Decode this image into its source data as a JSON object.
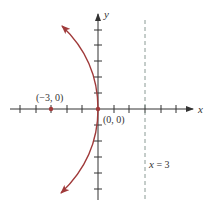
{
  "diagram": {
    "type": "coordinate-plane",
    "axes": {
      "x_label": "x",
      "y_label": "y",
      "x_ticks": [
        -5,
        -4,
        -3,
        -2,
        -1,
        1,
        2,
        3,
        4,
        5
      ],
      "y_ticks": [
        -5,
        -4,
        -3,
        -2,
        -1,
        1,
        2,
        3,
        4,
        5
      ]
    },
    "curve": {
      "name": "parabola",
      "equation": "y^2 = -12x",
      "color": "#a03a3a",
      "opens": "left"
    },
    "points": [
      {
        "label": "(−3, 0)",
        "x": -3,
        "y": 0,
        "role": "focus"
      },
      {
        "label": "(0, 0)",
        "x": 0,
        "y": 0,
        "role": "vertex"
      }
    ],
    "directrix": {
      "label_var": "x",
      "label_rest": " = 3",
      "x": 3,
      "color": "#8a9a94"
    }
  }
}
